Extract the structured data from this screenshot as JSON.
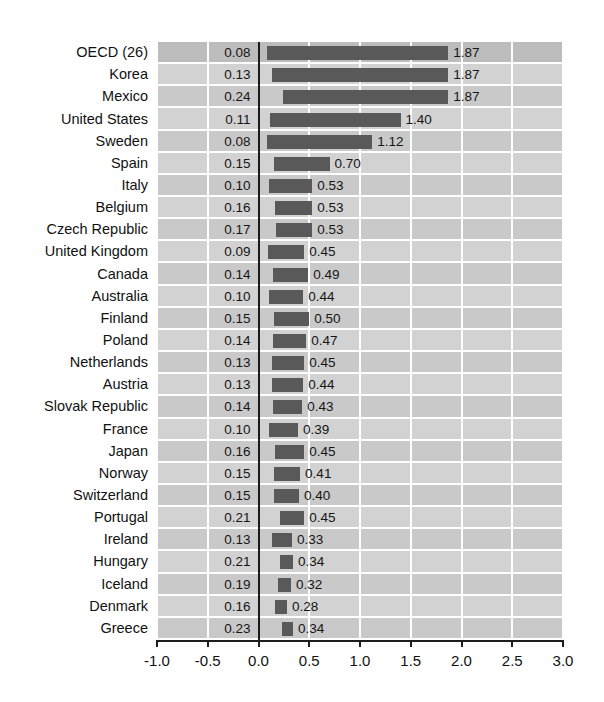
{
  "title_sliver": "",
  "chart_data": {
    "type": "bar",
    "orientation": "horizontal",
    "title": "",
    "xlabel": "",
    "ylabel": "",
    "xlim": [
      -1.0,
      3.0
    ],
    "xticks": [
      "-1.0",
      "-0.5",
      "0.0",
      "0.5",
      "1.0",
      "1.5",
      "2.0",
      "2.5",
      "3.0"
    ],
    "xtick_values": [
      -1.0,
      -0.5,
      0.0,
      0.5,
      1.0,
      1.5,
      2.0,
      2.5,
      3.0
    ],
    "grid": true,
    "legend": "none",
    "zero_line": 0.0,
    "note": "Each row shows a range: the left label is the lower bound and the right label is the upper bound; the dark bar spans between them.",
    "categories": [
      "OECD (26)",
      "Korea",
      "Mexico",
      "United States",
      "Sweden",
      "Spain",
      "Italy",
      "Belgium",
      "Czech Republic",
      "United Kingdom",
      "Canada",
      "Australia",
      "Finland",
      "Poland",
      "Netherlands",
      "Austria",
      "Slovak Republic",
      "France",
      "Japan",
      "Norway",
      "Switzerland",
      "Portugal",
      "Ireland",
      "Hungary",
      "Iceland",
      "Denmark",
      "Greece"
    ],
    "series": [
      {
        "name": "lower",
        "values": [
          0.08,
          0.13,
          0.24,
          0.11,
          0.08,
          0.15,
          0.1,
          0.16,
          0.17,
          0.09,
          0.14,
          0.1,
          0.15,
          0.14,
          0.13,
          0.13,
          0.14,
          0.1,
          0.16,
          0.15,
          0.15,
          0.21,
          0.13,
          0.21,
          0.19,
          0.16,
          0.23
        ]
      },
      {
        "name": "upper",
        "values": [
          1.87,
          1.87,
          1.87,
          1.4,
          1.12,
          0.7,
          0.53,
          0.53,
          0.53,
          0.45,
          0.49,
          0.44,
          0.5,
          0.47,
          0.45,
          0.44,
          0.43,
          0.39,
          0.45,
          0.41,
          0.4,
          0.45,
          0.33,
          0.34,
          0.32,
          0.28,
          0.34
        ]
      }
    ],
    "lower_labels": [
      "0.08",
      "0.13",
      "0.24",
      "0.11",
      "0.08",
      "0.15",
      "0.10",
      "0.16",
      "0.17",
      "0.09",
      "0.14",
      "0.10",
      "0.15",
      "0.14",
      "0.13",
      "0.13",
      "0.14",
      "0.10",
      "0.16",
      "0.15",
      "0.15",
      "0.21",
      "0.13",
      "0.21",
      "0.19",
      "0.16",
      "0.23"
    ],
    "upper_labels": [
      "1.87",
      "1.87",
      "1.87",
      "1.40",
      "1.12",
      "0.70",
      "0.53",
      "0.53",
      "0.53",
      "0.45",
      "0.49",
      "0.44",
      "0.50",
      "0.47",
      "0.45",
      "0.44",
      "0.43",
      "0.39",
      "0.45",
      "0.41",
      "0.40",
      "0.45",
      "0.33",
      "0.34",
      "0.32",
      "0.28",
      "0.34"
    ],
    "colors": {
      "bar": "#595959",
      "band_odd": "#c9c9c9",
      "band_even": "#d2d2d2",
      "band_first": "#bcbcbc",
      "gridline": "#ffffff",
      "axis": "#1d1d1d",
      "text": "#111111"
    }
  }
}
